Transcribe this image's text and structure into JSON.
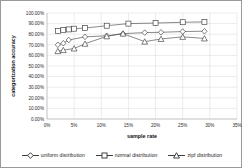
{
  "chart_data": {
    "type": "line",
    "title": "",
    "xlabel": "sample rate",
    "ylabel": "categorization accuracy",
    "xlim": [
      0,
      35
    ],
    "ylim": [
      0,
      100
    ],
    "grid": true,
    "legend_position": "bottom",
    "x_tick_labels": [
      "0%",
      "5%",
      "10%",
      "15%",
      "20%",
      "25%",
      "30%",
      "35%"
    ],
    "x_ticks": [
      0,
      5,
      10,
      15,
      20,
      25,
      30,
      35
    ],
    "y_tick_labels": [
      "0.00%",
      "10.00%",
      "20.00%",
      "30.00%",
      "40.00%",
      "50.00%",
      "60.00%",
      "70.00%",
      "80.00%",
      "90.00%",
      "100.00%"
    ],
    "y_ticks": [
      0,
      10,
      20,
      30,
      40,
      50,
      60,
      70,
      80,
      90,
      100
    ],
    "series": [
      {
        "name": "uniform distribution",
        "marker": "diamond",
        "x": [
          2,
          3,
          4,
          7,
          11,
          14,
          18,
          21,
          25,
          29
        ],
        "values": [
          70.0,
          71.5,
          74.5,
          77.5,
          78.5,
          80.5,
          81.5,
          81.8,
          82.5,
          82.8
        ]
      },
      {
        "name": "normal distribution",
        "marker": "square",
        "x": [
          2,
          3,
          4,
          5,
          7,
          11,
          15,
          20,
          25,
          29
        ],
        "values": [
          83.0,
          83.8,
          84.5,
          85.2,
          85.8,
          88.0,
          90.0,
          90.5,
          91.3,
          91.6
        ]
      },
      {
        "name": "zipf distribution",
        "marker": "triangle",
        "x": [
          2,
          3,
          5,
          7,
          11,
          14,
          18,
          21,
          25,
          29
        ],
        "values": [
          64.0,
          65.0,
          66.5,
          71.0,
          78.0,
          80.5,
          73.0,
          75.5,
          77.5,
          76.0
        ]
      }
    ]
  },
  "legend": {
    "items": [
      {
        "label": "uniform distribution",
        "marker": "diamond"
      },
      {
        "label": "normal distribution",
        "marker": "square"
      },
      {
        "label": "zipf distribution",
        "marker": "triangle"
      }
    ]
  },
  "colors": {
    "line": "#4a4a4a",
    "marker_stroke": "#333333",
    "marker_fill": "#ffffff",
    "grid": "#d9d9d9",
    "border": "#9a9a9a",
    "text": "#1a1a1a"
  }
}
